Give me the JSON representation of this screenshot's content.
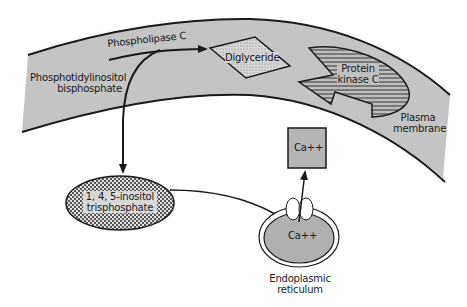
{
  "diagram": {
    "colors": {
      "membrane_fill": "#c4c4c4",
      "outline": "#1a1a1a",
      "box_fill": "#b5b5b5",
      "er_fill": "#b0b0b0",
      "background": "#ffffff"
    },
    "labels": {
      "phospholipase_c": "Phospholipase C",
      "pip2_line1": "Phosphotidylinositol",
      "pip2_line2": "bisphosphate",
      "diglyceride": "Diglyceride",
      "pkc_line1": "Protein",
      "pkc_line2": "kinase C",
      "plasma_membrane_line1": "Plasma",
      "plasma_membrane_line2": "membrane",
      "calcium_cytosol": "Ca++",
      "ip3_line1": "1, 4, 5-inositol",
      "ip3_line2": "trisphosphate",
      "calcium_er": "Ca++",
      "er_line1": "Endoplasmic",
      "er_line2": "reticulum"
    },
    "nodes": [
      {
        "id": "pip2",
        "label": "Phosphotidylinositol bisphosphate",
        "location": "plasma membrane"
      },
      {
        "id": "plc",
        "label": "Phospholipase C",
        "location": "plasma membrane"
      },
      {
        "id": "dag",
        "label": "Diglyceride",
        "shape": "parallelogram"
      },
      {
        "id": "pkc",
        "label": "Protein kinase C",
        "shape": "pac-man with notch"
      },
      {
        "id": "ip3",
        "label": "1, 4, 5-inositol trisphosphate",
        "shape": "ellipse"
      },
      {
        "id": "er",
        "label": "Endoplasmic reticulum",
        "shape": "ellipse"
      },
      {
        "id": "ca_cyto",
        "label": "Ca++",
        "shape": "square"
      }
    ],
    "edges": [
      {
        "from": "plc",
        "to": "dag",
        "type": "arrow"
      },
      {
        "from": "plc",
        "to": "ip3",
        "type": "arrow"
      },
      {
        "from": "ip3",
        "to": "er",
        "type": "line"
      },
      {
        "from": "er",
        "to": "ca_cyto",
        "type": "arrow"
      }
    ]
  }
}
